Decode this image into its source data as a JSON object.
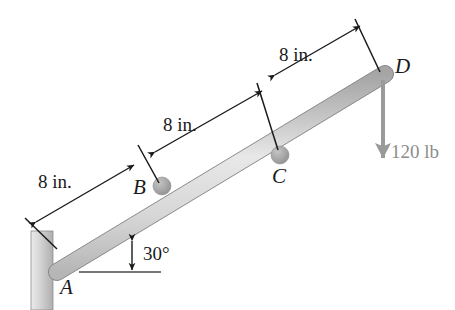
{
  "figure": {
    "background_color": "#ffffff"
  },
  "points": {
    "a": "A",
    "b": "B",
    "c": "C",
    "d": "D"
  },
  "dimensions": {
    "ab": "8 in.",
    "bc": "8 in.",
    "cd": "8 in."
  },
  "angle": {
    "value": "30°"
  },
  "load": {
    "magnitude": "120 lb",
    "color": "#9a9a9a",
    "direction": "down"
  },
  "colors": {
    "line": "#1a1a1a",
    "bar_light": "#f0f0f0",
    "bar_mid": "#c9c9c9",
    "bar_dark": "#9f9f9f",
    "wall_light": "#e4e4e4",
    "wall_dark": "#b4b4b4",
    "collar": "#a8a8a8",
    "text": "#1a1a1a"
  },
  "geometry": {
    "bar_start": [
      57,
      272
    ],
    "bar_end": [
      385,
      74
    ],
    "wall_rect": [
      31,
      231,
      22,
      79
    ],
    "collar_b": [
      162,
      186
    ],
    "collar_c": [
      280,
      155
    ],
    "force_arrow": [
      383,
      80,
      383,
      160
    ],
    "ground_line": [
      79,
      272,
      161,
      272
    ]
  }
}
